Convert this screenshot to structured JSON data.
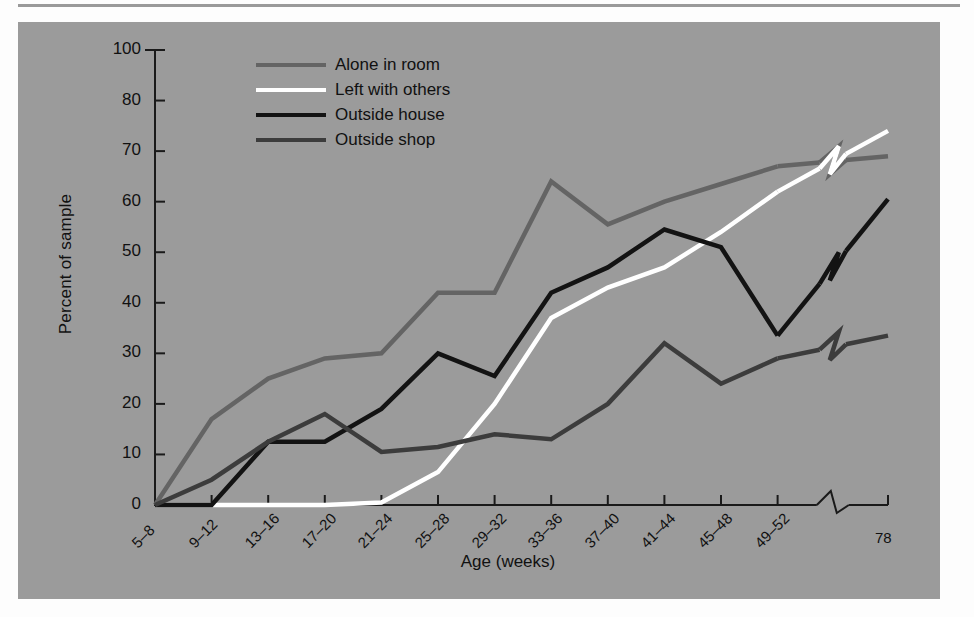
{
  "figure": {
    "background_color": "#9b9b9b",
    "page_color": "#fdfdfd",
    "rule_color": "#9a9a9a"
  },
  "chart_data": {
    "type": "line",
    "title": "",
    "xlabel": "Age (weeks)",
    "ylabel": "Percent of sample",
    "grid": false,
    "legend_position": "top-center",
    "axis_break_x": true,
    "axis_break_note": "break between the 49–52 category and 78",
    "categories": [
      "5–8",
      "9–12",
      "13–16",
      "17–20",
      "21–24",
      "25–28",
      "29–32",
      "33–36",
      "37–40",
      "41–44",
      "45–48",
      "49–52",
      "78"
    ],
    "ylim": [
      0,
      100
    ],
    "yticks": [
      0,
      10,
      20,
      30,
      40,
      50,
      60,
      70,
      80,
      100
    ],
    "ytick_labels": [
      "0",
      "10",
      "20",
      "30",
      "40",
      "50",
      "60",
      "70",
      "80",
      "100"
    ],
    "series": [
      {
        "name": "Alone in room",
        "color": "#646464",
        "values": [
          0,
          17,
          25,
          29,
          30,
          42,
          42,
          64,
          55.5,
          60,
          63.5,
          67,
          69
        ]
      },
      {
        "name": "Left with others",
        "color": "#ffffff",
        "values": [
          0,
          0,
          0,
          0,
          0.5,
          6.5,
          20,
          37,
          43,
          47,
          54,
          62,
          74
        ]
      },
      {
        "name": "Outside house",
        "color": "#131313",
        "values": [
          0,
          0,
          12.5,
          12.5,
          19,
          30,
          25.5,
          42,
          47,
          54.5,
          51,
          33.5,
          60.5
        ]
      },
      {
        "name": "Outside shop",
        "color": "#3c3c3c",
        "values": [
          0,
          5,
          12.5,
          18,
          10.5,
          11.5,
          14,
          13,
          20,
          32,
          24,
          29,
          33.5
        ]
      }
    ]
  },
  "legend": {
    "items": [
      {
        "label": "Alone in room",
        "color": "#646464"
      },
      {
        "label": "Left with others",
        "color": "#ffffff"
      },
      {
        "label": "Outside house",
        "color": "#131313"
      },
      {
        "label": "Outside shop",
        "color": "#3c3c3c"
      }
    ]
  }
}
